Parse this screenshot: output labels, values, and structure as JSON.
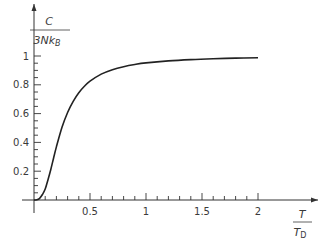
{
  "chart_data": {
    "type": "line",
    "title": "",
    "xlabel": {
      "numerator": "T",
      "denominator": "T",
      "denominator_sub": "D"
    },
    "ylabel": {
      "numerator": "C",
      "denominator": "3Nk",
      "denominator_sub": "B"
    },
    "xlim": [
      0,
      2.3
    ],
    "ylim": [
      0,
      1.1
    ],
    "grid": false,
    "legend": null,
    "x_ticks": [
      0.5,
      1,
      1.5,
      2
    ],
    "x_tick_labels": [
      "0.5",
      "1",
      "1.5",
      "2"
    ],
    "x_minor_step": 0.1,
    "y_ticks": [
      0.2,
      0.4,
      0.6,
      0.8,
      1
    ],
    "y_tick_labels": [
      "0.2",
      "0.4",
      "0.6",
      "0.8",
      "1"
    ],
    "y_minor_step": 0.05,
    "series": [
      {
        "name": "Debye heat capacity",
        "x": [
          0,
          0.025,
          0.05,
          0.075,
          0.1,
          0.125,
          0.15,
          0.175,
          0.2,
          0.25,
          0.3,
          0.35,
          0.4,
          0.45,
          0.5,
          0.6,
          0.7,
          0.8,
          0.9,
          1.0,
          1.2,
          1.4,
          1.6,
          1.8,
          2.0
        ],
        "values": [
          0,
          0.0015,
          0.0117,
          0.038,
          0.0758,
          0.141,
          0.212,
          0.292,
          0.369,
          0.505,
          0.608,
          0.685,
          0.745,
          0.79,
          0.825,
          0.874,
          0.905,
          0.926,
          0.941,
          0.952,
          0.966,
          0.975,
          0.981,
          0.985,
          0.988
        ]
      }
    ],
    "line_color": "#222222",
    "axis_color": "#333333"
  }
}
